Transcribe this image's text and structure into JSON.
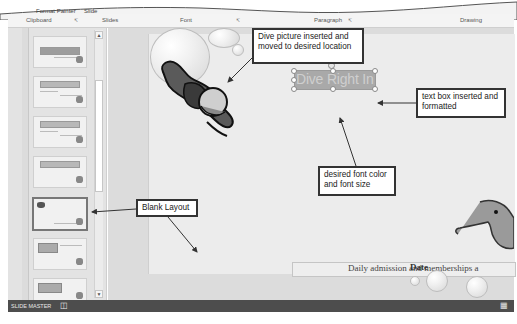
{
  "ribbon": {
    "top_items": [
      "Format Painter",
      "Slide"
    ],
    "groups": [
      "Clipboard",
      "Slides",
      "Font",
      "Paragraph",
      "Drawing"
    ]
  },
  "thumbnails": {
    "count": 7,
    "selected_index": 4,
    "selected_label": "Blank Layout"
  },
  "slide": {
    "textbox_text": "Dive Right In!",
    "footer_text": "Daily admission and memberships a",
    "footer_overlay": "Date"
  },
  "status_bar": {
    "mode": "SLIDE MASTER",
    "icon": "notes-icon"
  },
  "callouts": {
    "dive_picture": "Dive picture inserted and moved to desired location",
    "text_box": "text box inserted and formatted",
    "font": "desired font color and font size",
    "blank_layout": "Blank Layout"
  },
  "colors": {
    "status_bar": "#4d4d4d",
    "textbox_fill": "#a9a9a9",
    "callout_border": "#333333"
  }
}
